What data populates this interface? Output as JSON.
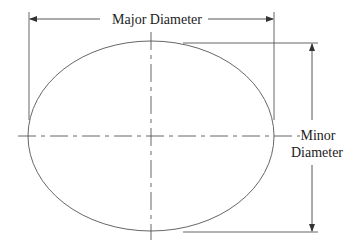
{
  "diagram": {
    "type": "ellipse-dimensions",
    "labels": {
      "major": "Major Diameter",
      "minor_line1": "Minor",
      "minor_line2": "Diameter"
    },
    "colors": {
      "stroke": "#555555",
      "text": "#222222"
    }
  }
}
